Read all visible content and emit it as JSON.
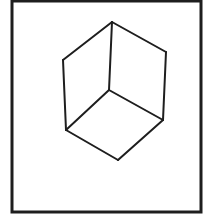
{
  "figure": {
    "colors": {
      "background": "#ffffff",
      "stroke": "#1e1e1e"
    },
    "frame": {
      "x1": 12,
      "y1": 1,
      "x2": 201,
      "y2": 212,
      "stroke_width": 3
    },
    "vertices": {
      "top": [
        112,
        22
      ],
      "upper_left": [
        63,
        60
      ],
      "upper_right": [
        166,
        52
      ],
      "center": [
        109,
        90
      ],
      "lower_left": [
        66,
        130
      ],
      "lower_right": [
        163,
        120
      ],
      "bottom": [
        118,
        160
      ]
    },
    "edges": [
      [
        "top",
        "upper_left"
      ],
      [
        "top",
        "upper_right"
      ],
      [
        "top",
        "center"
      ],
      [
        "upper_left",
        "lower_left"
      ],
      [
        "upper_right",
        "lower_right"
      ],
      [
        "center",
        "lower_left"
      ],
      [
        "center",
        "lower_right"
      ],
      [
        "lower_left",
        "bottom"
      ],
      [
        "lower_right",
        "bottom"
      ]
    ],
    "edge_stroke_width": 2
  }
}
